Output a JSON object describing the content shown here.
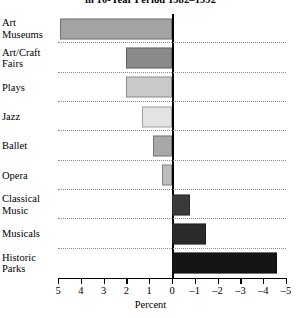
{
  "chart_data": {
    "type": "bar",
    "orientation": "horizontal",
    "title": "in 10-Year Period 1982–1992",
    "xlabel": "Percent",
    "ylabel": "",
    "xlim": [
      5,
      -5
    ],
    "x_axis_reversed": true,
    "xticks": [
      5,
      4,
      3,
      2,
      1,
      0,
      -1,
      -2,
      -3,
      -4,
      -5
    ],
    "xticklabels": [
      "5",
      "4",
      "3",
      "2",
      "1",
      "0",
      "–1",
      "–2",
      "–3",
      "–4",
      "–5"
    ],
    "grid": "dotted-horizontal-row-separators",
    "legend": "none",
    "categories": [
      "Art Museums",
      "Art/Craft Fairs",
      "Plays",
      "Jazz",
      "Ballet",
      "Opera",
      "Classical Music",
      "Musicals",
      "Historic Parks"
    ],
    "values": [
      4.9,
      2.0,
      2.0,
      1.3,
      0.85,
      0.45,
      -0.8,
      -1.5,
      -4.6
    ],
    "bar_colors": [
      "#a3a3a3",
      "#8a8a8a",
      "#c9c9c9",
      "#e3e3e3",
      "#a8a8a8",
      "#bdbdbd",
      "#3a3a3a",
      "#2b2b2b",
      "#151515"
    ],
    "points": [
      {
        "category": "Art Museums",
        "value": 4.9,
        "color": "#a3a3a3"
      },
      {
        "category": "Art/Craft Fairs",
        "value": 2.0,
        "color": "#8a8a8a"
      },
      {
        "category": "Plays",
        "value": 2.0,
        "color": "#c9c9c9"
      },
      {
        "category": "Jazz",
        "value": 1.3,
        "color": "#e3e3e3"
      },
      {
        "category": "Ballet",
        "value": 0.85,
        "color": "#a8a8a8"
      },
      {
        "category": "Opera",
        "value": 0.45,
        "color": "#bdbdbd"
      },
      {
        "category": "Classical Music",
        "value": -0.8,
        "color": "#3a3a3a"
      },
      {
        "category": "Musicals",
        "value": -1.5,
        "color": "#2b2b2b"
      },
      {
        "category": "Historic Parks",
        "value": -4.6,
        "color": "#151515"
      }
    ]
  },
  "category_label_lines": [
    [
      "Art",
      "Museums"
    ],
    [
      "Art/Craft",
      "Fairs"
    ],
    [
      "Plays"
    ],
    [
      "Jazz"
    ],
    [
      "Ballet"
    ],
    [
      "Opera"
    ],
    [
      "Classical",
      "Music"
    ],
    [
      "Musicals"
    ],
    [
      "Historic",
      "Parks"
    ]
  ]
}
